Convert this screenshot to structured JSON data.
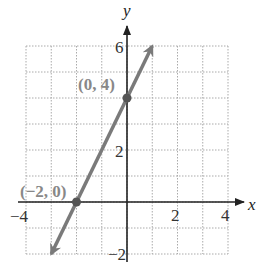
{
  "chart_data": {
    "type": "line",
    "title": "",
    "xlabel": "x",
    "ylabel": "y",
    "xlim": [
      -4,
      4
    ],
    "ylim": [
      -2,
      6
    ],
    "grid": true,
    "x_ticks": [
      -4,
      2,
      4
    ],
    "y_ticks": [
      6,
      2,
      -2
    ],
    "x_tick_labels": [
      "−4",
      "2",
      "4"
    ],
    "y_tick_labels": [
      "6",
      "2",
      "−2"
    ],
    "series": [
      {
        "name": "y = 2x + 4",
        "x": [
          -3,
          1
        ],
        "y": [
          -2,
          6
        ],
        "arrows": "both"
      }
    ],
    "annotations": [
      {
        "label": "(0, 4)",
        "x": 0,
        "y": 4
      },
      {
        "label": "(−2, 0)",
        "x": -2,
        "y": 0
      }
    ],
    "colors": {
      "line": "#7a7a7a",
      "axes": "#222222",
      "grid": "#aaaaaa"
    }
  }
}
